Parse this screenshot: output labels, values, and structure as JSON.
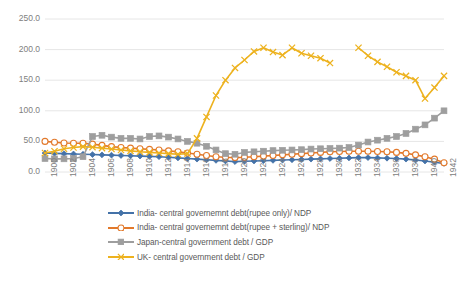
{
  "chart_data": {
    "type": "line",
    "title": "",
    "xlabel": "",
    "ylabel": "",
    "ylim": [
      0,
      250
    ],
    "yticks": [
      "0.0",
      "50.0",
      "100.0",
      "150.0",
      "200.0",
      "250.0"
    ],
    "grid": true,
    "legend_position": "bottom",
    "x": [
      1900,
      1901,
      1902,
      1903,
      1904,
      1905,
      1906,
      1907,
      1908,
      1909,
      1910,
      1911,
      1912,
      1913,
      1914,
      1915,
      1916,
      1917,
      1918,
      1919,
      1920,
      1921,
      1922,
      1923,
      1924,
      1925,
      1926,
      1927,
      1928,
      1929,
      1930,
      1931,
      1932,
      1933,
      1934,
      1935,
      1936,
      1937,
      1938,
      1939,
      1940,
      1941,
      1942
    ],
    "xticklabels": [
      "1900",
      "1902",
      "1904",
      "1906",
      "1908",
      "1910",
      "1912",
      "1914",
      "1916",
      "1918",
      "1920",
      "1922",
      "1924",
      "1926",
      "1928",
      "1930",
      "1932",
      "1934",
      "1936",
      "1938",
      "1940",
      "1942"
    ],
    "series": [
      {
        "name": "India- central governemnt debt(rupee only)/ NDP",
        "color": "#4472A8",
        "marker": "diamond",
        "values": [
          31.0,
          30.5,
          30.0,
          29.5,
          29.0,
          28.5,
          28.0,
          27.5,
          27.0,
          26.5,
          26.0,
          25.5,
          25.0,
          24.0,
          23.0,
          22.0,
          21.0,
          20.0,
          19.0,
          18.0,
          17.0,
          17.5,
          18.0,
          18.5,
          19.0,
          19.5,
          20.0,
          20.5,
          21.0,
          21.5,
          22.0,
          22.5,
          23.0,
          23.5,
          23.5,
          23.0,
          22.5,
          22.0,
          21.0,
          19.5,
          18.0,
          16.0,
          14.0
        ]
      },
      {
        "name": "India- central governemnt debt(rupee + sterling)/ NDP",
        "color": "#E2792B",
        "marker": "circle",
        "values": [
          50.0,
          48.5,
          47.5,
          47.0,
          47.0,
          45.5,
          43.5,
          41.5,
          40.0,
          39.0,
          38.0,
          37.0,
          36.0,
          34.5,
          33.0,
          31.0,
          29.0,
          27.0,
          25.0,
          24.0,
          23.5,
          24.0,
          25.0,
          26.0,
          27.0,
          28.0,
          29.0,
          30.0,
          31.0,
          32.0,
          33.0,
          33.5,
          34.0,
          34.0,
          34.0,
          33.5,
          33.0,
          32.0,
          30.5,
          28.0,
          25.0,
          21.0,
          15.0
        ]
      },
      {
        "name": "Japan-central government debt / GDP",
        "color": "#9E9E9E",
        "marker": "square",
        "values": [
          22.0,
          21.5,
          21.5,
          22.0,
          25.0,
          58.0,
          60.0,
          57.0,
          55.0,
          55.0,
          54.0,
          58.0,
          59.0,
          57.0,
          54.0,
          50.0,
          47.0,
          42.0,
          36.0,
          30.0,
          29.0,
          32.0,
          33.0,
          34.0,
          35.0,
          35.5,
          36.0,
          36.5,
          37.5,
          38.0,
          38.5,
          39.0,
          40.0,
          44.0,
          49.0,
          52.0,
          55.0,
          58.0,
          63.0,
          70.0,
          77.0,
          88.0,
          100.0
        ]
      },
      {
        "name": "UK- central government debt / GDP",
        "color": "#EDB21E",
        "marker": "x",
        "values": [
          31.0,
          34.0,
          38.0,
          40.0,
          41.5,
          40.5,
          39.0,
          37.5,
          36.0,
          34.5,
          33.0,
          32.0,
          31.0,
          30.0,
          29.0,
          30.0,
          55.0,
          90.0,
          125.0,
          150.0,
          170.0,
          183.0,
          197.0,
          203.0,
          196.0,
          191.0,
          203.0,
          194.0,
          190.0,
          186.0,
          178.0,
          null,
          null,
          203.0,
          190.0,
          180.0,
          172.0,
          163.0,
          157.0,
          150.0,
          120.0,
          138.0,
          157.0
        ]
      }
    ]
  },
  "axes": {
    "y_ticks": [
      {
        "label": "250.0",
        "value": 250
      },
      {
        "label": "200.0",
        "value": 200
      },
      {
        "label": "150.0",
        "value": 150
      },
      {
        "label": "100.0",
        "value": 100
      },
      {
        "label": "50.0",
        "value": 50
      },
      {
        "label": "0.0",
        "value": 0
      }
    ],
    "x_ticks": [
      {
        "label": "1900"
      },
      {
        "label": "1902"
      },
      {
        "label": "1904"
      },
      {
        "label": "1906"
      },
      {
        "label": "1908"
      },
      {
        "label": "1910"
      },
      {
        "label": "1912"
      },
      {
        "label": "1914"
      },
      {
        "label": "1916"
      },
      {
        "label": "1918"
      },
      {
        "label": "1920"
      },
      {
        "label": "1922"
      },
      {
        "label": "1924"
      },
      {
        "label": "1926"
      },
      {
        "label": "1928"
      },
      {
        "label": "1930"
      },
      {
        "label": "1932"
      },
      {
        "label": "1934"
      },
      {
        "label": "1936"
      },
      {
        "label": "1938"
      },
      {
        "label": "1940"
      },
      {
        "label": "1942"
      }
    ]
  },
  "legend": {
    "items": [
      {
        "label": "India- central governemnt debt(rupee only)/ NDP",
        "color": "#4472A8"
      },
      {
        "label": "India- central governemnt debt(rupee + sterling)/ NDP",
        "color": "#E2792B"
      },
      {
        "label": "Japan-central government debt / GDP",
        "color": "#9E9E9E"
      },
      {
        "label": "UK- central government debt / GDP",
        "color": "#EDB21E"
      }
    ]
  },
  "colors": {
    "grid": "#E6E6E6",
    "text": "#808080",
    "legend_text": "#595959",
    "background": "#FFFFFF"
  }
}
